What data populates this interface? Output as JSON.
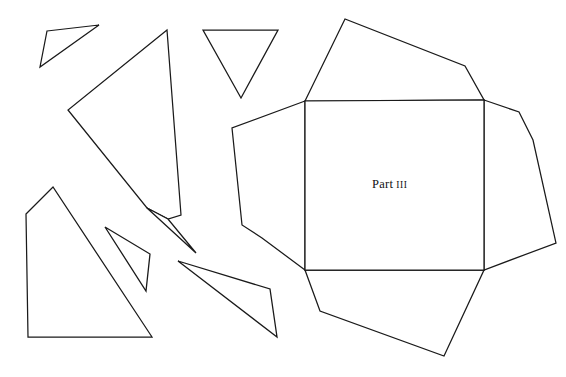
{
  "figure": {
    "canvas": {
      "width": 566,
      "height": 377
    },
    "background_color": "#ffffff",
    "stroke_color": "#1a1a1a",
    "fill_color": "#ffffff",
    "label": {
      "full_text": "Part III",
      "word": "Part",
      "numeral": "III",
      "x": 372,
      "y": 174,
      "color": "#111111"
    },
    "shapes": [
      {
        "name": "small-triangle-top-left",
        "type": "polygon",
        "points": "47,31 99,25 40,67"
      },
      {
        "name": "large-quadrilateral-left",
        "type": "polygon",
        "points": "167,30 181,215 168,219 147,208 68,110"
      },
      {
        "name": "inverted-triangle-top",
        "type": "polygon",
        "points": "203,30 278,30 241,98"
      },
      {
        "name": "arrow-sliver-center",
        "type": "polygon",
        "points": "147,208 196,253 168,219"
      },
      {
        "name": "pentagon-bottom-left",
        "type": "polygon",
        "points": "26,214 53,187 152,337 28,337"
      },
      {
        "name": "thin-sliver-left",
        "type": "polygon",
        "points": "105,227 150,254 146,291"
      },
      {
        "name": "thin-sliver-right",
        "type": "polygon",
        "points": "178,261 270,289 277,337"
      },
      {
        "name": "net-top-flap",
        "type": "polygon",
        "points": "305,101 345,19 465,66 484,100"
      },
      {
        "name": "net-left-flap",
        "type": "polygon",
        "points": "305,101 232,128 242,225 262,238 305,270"
      },
      {
        "name": "net-right-flap",
        "type": "polygon",
        "points": "484,100 519,112 533,140 556,243 484,270"
      },
      {
        "name": "net-bottom-flap",
        "type": "polygon",
        "points": "305,270 484,270 444,356 320,311"
      },
      {
        "name": "net-center-square",
        "type": "polygon",
        "points": "305,101 484,100 484,270 305,270"
      }
    ]
  }
}
